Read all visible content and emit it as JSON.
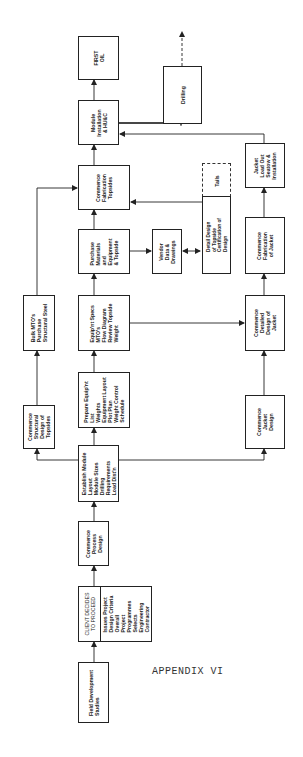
{
  "diagram": {
    "orientation": "rotated 90deg counter-clockwise (flow from bottom to top)",
    "caption": "APPENDIX VI",
    "nodes": [
      {
        "id": "field_dev",
        "label": "Field Development\nStudies"
      },
      {
        "id": "client_decides",
        "label": "CLIENT DECIDES\nTO PROCEED"
      },
      {
        "id": "client_issues",
        "label": "Issues Project\nDesign Criteria\nOverall\nProject\nProgrammes\nSelects\nEngineering\nContractor"
      },
      {
        "id": "process_design",
        "label": "Commence\nProcess\nDesign"
      },
      {
        "id": "establish_module",
        "label": "Establish Module\nLayout\nModule Sizes\nDrilling\nRequirements\nLoad Dist'n"
      },
      {
        "id": "structural_design",
        "label": "Commence\nStructural\nDesign of\nTopsides"
      },
      {
        "id": "prepare_equip",
        "label": "Prepare Equip'nt\nList\nWeights\nEquipment Layout\nPlot Plan\nWeight Control\nSchedule"
      },
      {
        "id": "jacket_design",
        "label": "Commence\nJacket\nDesign"
      },
      {
        "id": "bulk_mto",
        "label": "Bulk MTO's\nPurchase\nStructural Steel"
      },
      {
        "id": "equip_specs",
        "label": "Equip'nt Specs\nMTO's\nFlow Diagram\nReview Topside\nWeight"
      },
      {
        "id": "detailed_jacket",
        "label": "Commence\nDetailed\nDesign of\nJacket"
      },
      {
        "id": "purchase_materials",
        "label": "Purchase\nMaterials\nand\nEquipment\n& Topside"
      },
      {
        "id": "vendor_data",
        "label": "Vendor\nData &\nDrawings"
      },
      {
        "id": "detail_design_topside",
        "label": "Detail Design\nof Topside\nCertification of\nDesign"
      },
      {
        "id": "tails",
        "label": "Tails"
      },
      {
        "id": "fab_jacket",
        "label": "Commence\nFabrication\nof Jacket"
      },
      {
        "id": "fab_topsides",
        "label": "Commence\nFabrication\nTopsides"
      },
      {
        "id": "jacket_loadout",
        "label": "Jacket\nLoad Out\nSeatow &\nInstallation"
      },
      {
        "id": "module_install",
        "label": "Module\nInstallation\n& HU&C"
      },
      {
        "id": "drilling",
        "label": "Drilling"
      },
      {
        "id": "first_oil",
        "label": "FIRST\nOIL"
      }
    ],
    "edges": [
      {
        "from": "field_dev",
        "to": "client_decides"
      },
      {
        "from": "client_decides",
        "to": "process_design"
      },
      {
        "from": "process_design",
        "to": "establish_module"
      },
      {
        "from": "establish_module",
        "to": "structural_design"
      },
      {
        "from": "establish_module",
        "to": "prepare_equip"
      },
      {
        "from": "establish_module",
        "to": "jacket_design"
      },
      {
        "from": "structural_design",
        "to": "bulk_mto"
      },
      {
        "from": "bulk_mto",
        "to": "fab_topsides"
      },
      {
        "from": "prepare_equip",
        "to": "equip_specs"
      },
      {
        "from": "equip_specs",
        "to": "purchase_materials"
      },
      {
        "from": "equip_specs",
        "to": "detailed_jacket"
      },
      {
        "from": "jacket_design",
        "to": "detailed_jacket"
      },
      {
        "from": "purchase_materials",
        "to": "vendor_data"
      },
      {
        "from": "vendor_data",
        "to": "detail_design_topside",
        "bidirectional": true
      },
      {
        "from": "detail_design_topside",
        "to": "fab_topsides"
      },
      {
        "from": "purchase_materials",
        "to": "fab_topsides"
      },
      {
        "from": "detailed_jacket",
        "to": "fab_jacket"
      },
      {
        "from": "fab_jacket",
        "to": "jacket_loadout"
      },
      {
        "from": "jacket_loadout",
        "to": "module_install"
      },
      {
        "from": "fab_topsides",
        "to": "module_install"
      },
      {
        "from": "module_install",
        "to": "first_oil"
      },
      {
        "from": "module_install",
        "to": "drilling"
      },
      {
        "from": "drilling",
        "to": "continuation",
        "style": "dashed"
      }
    ]
  }
}
